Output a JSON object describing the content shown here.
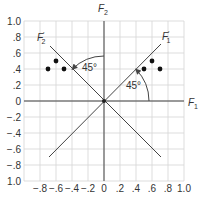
{
  "diagram": {
    "type": "factor-rotation-plot",
    "grid": {
      "x_range": [
        -1.0,
        1.0
      ],
      "y_range": [
        -1.0,
        1.0
      ],
      "step": 0.2,
      "grid_color": "#d0d0d0",
      "line_color": "#444444"
    },
    "x_tick_labels": [
      "−.8",
      "−.6",
      "−.4",
      "−.2",
      "0",
      ".2",
      ".4",
      ".6",
      ".8",
      "1.0"
    ],
    "y_tick_labels": [
      "1.0",
      ".8",
      ".6",
      ".4",
      ".2",
      "0",
      "−.2",
      "−.4",
      "−.6",
      "−.8",
      "1.0"
    ],
    "axes": {
      "f1": {
        "label": "F",
        "sub": "1"
      },
      "f2": {
        "label": "F",
        "sub": "2"
      },
      "f1_rotated": {
        "label": "F",
        "sub": "1",
        "prime": "′"
      },
      "f2_rotated": {
        "label": "F",
        "sub": "2",
        "prime": "′"
      }
    },
    "angles": {
      "left": "45°",
      "right": "45°"
    },
    "points_left": [
      {
        "x": -0.7,
        "y": 0.4
      },
      {
        "x": -0.6,
        "y": 0.5
      },
      {
        "x": -0.5,
        "y": 0.4
      }
    ],
    "points_right": [
      {
        "x": 0.5,
        "y": 0.4
      },
      {
        "x": 0.6,
        "y": 0.5
      },
      {
        "x": 0.7,
        "y": 0.4
      }
    ]
  }
}
